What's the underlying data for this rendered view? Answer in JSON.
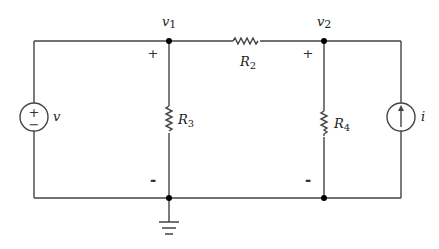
{
  "nodes": {
    "v1": {
      "label": "v",
      "sub": "1"
    },
    "v2": {
      "label": "v",
      "sub": "2"
    }
  },
  "components": {
    "voltage_source": {
      "label": "v",
      "plus": "+",
      "minus": "−"
    },
    "R2": {
      "label": "R",
      "sub": "2"
    },
    "R3": {
      "label": "R",
      "sub": "3"
    },
    "R4": {
      "label": "R",
      "sub": "4"
    },
    "current_source": {
      "label": "i"
    }
  },
  "polarity": {
    "v1_plus": "+",
    "v1_minus": "-",
    "v2_plus": "+",
    "v2_minus": "-"
  },
  "colors": {
    "wire": "#444444",
    "node": "#000000"
  }
}
